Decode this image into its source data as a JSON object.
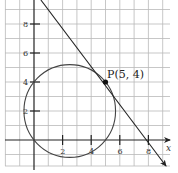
{
  "diagram": {
    "type": "coordinate-plane",
    "x_axis_label": "x",
    "x_ticks": [
      {
        "value": 2,
        "label": "2"
      },
      {
        "value": 4,
        "label": "4"
      },
      {
        "value": 6,
        "label": "6"
      },
      {
        "value": 8,
        "label": "8"
      }
    ],
    "y_ticks": [
      {
        "value": 2,
        "label": "2"
      },
      {
        "value": 4,
        "label": "4"
      },
      {
        "value": 6,
        "label": "6"
      },
      {
        "value": 8,
        "label": "8"
      }
    ],
    "grid_spacing": 1,
    "circle": {
      "center": [
        2.5,
        2
      ],
      "radius": 3.2
    },
    "tangent_line": {
      "through": [
        5,
        4
      ],
      "slope": -1.25,
      "arrow_end": true
    },
    "point": {
      "name": "P",
      "coords": [
        5,
        4
      ],
      "label": "P(5, 4)"
    },
    "colors": {
      "grid": "#b9b9b9",
      "axis": "#222222",
      "curve": "#444444"
    }
  }
}
